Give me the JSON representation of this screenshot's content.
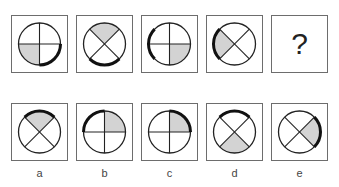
{
  "puzzle": {
    "question_row": [
      {
        "id": "q1",
        "cross": "plus",
        "shaded": "bottom-left",
        "thick_arc": "bottom-right"
      },
      {
        "id": "q2",
        "cross": "x",
        "shaded": "top",
        "thick_arc": "bottom"
      },
      {
        "id": "q3",
        "cross": "plus",
        "shaded": "bottom-right",
        "thick_arc": "left"
      },
      {
        "id": "q4",
        "cross": "x",
        "shaded": "left",
        "thick_arc": "left"
      },
      {
        "id": "q5",
        "unknown": "?"
      }
    ],
    "options": [
      {
        "label": "a",
        "cross": "x",
        "shaded": "top",
        "thick_arc": "top"
      },
      {
        "label": "b",
        "cross": "plus",
        "shaded": "top-right",
        "thick_arc": "top-left"
      },
      {
        "label": "c",
        "cross": "plus",
        "shaded": "top-right",
        "thick_arc": "top-right"
      },
      {
        "label": "d",
        "cross": "x",
        "shaded": "bottom",
        "thick_arc": "top"
      },
      {
        "label": "e",
        "cross": "x",
        "shaded": "right",
        "thick_arc": "right"
      }
    ],
    "colors": {
      "shade": "#d3d3d3",
      "line": "#222222",
      "border": "#6d6d6d"
    }
  }
}
